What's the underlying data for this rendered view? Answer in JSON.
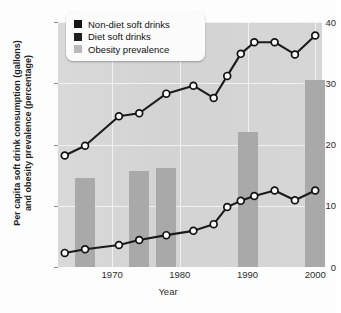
{
  "chart_data": {
    "type": "line",
    "title": "",
    "xlabel": "Year",
    "ylabel": "Per capita soft drink consumption (gallons) and obesity prevalence (percentage)",
    "ylabel_line1": "Per capita soft drink consumption (gallons)",
    "ylabel_line2": "and obesity prevalence (percentage)",
    "xlim": [
      1962,
      2001
    ],
    "ylim": [
      0,
      40
    ],
    "yticks": [
      0,
      10,
      20,
      30,
      40
    ],
    "xticks": [
      1970,
      1980,
      1990,
      2000
    ],
    "grid": true,
    "legend_position": "top-left",
    "legend": [
      {
        "label": "Non-diet soft drinks",
        "marker": "square",
        "color": "#141414"
      },
      {
        "label": "Diet soft drinks",
        "marker": "square",
        "color": "#1f1f1f"
      },
      {
        "label": "Obesity prevalence",
        "marker": "square",
        "color": "#b3b3b3"
      }
    ],
    "series": [
      {
        "name": "Non-diet soft drinks",
        "type": "line",
        "color": "#141414",
        "x": [
          1963,
          1966,
          1971,
          1974,
          1978,
          1982,
          1985,
          1987,
          1989,
          1991,
          1994,
          1997,
          2000
        ],
        "values": [
          18.2,
          19.8,
          24.6,
          25.1,
          28.3,
          29.6,
          27.6,
          31.2,
          34.8,
          36.7,
          36.7,
          34.7,
          37.8
        ]
      },
      {
        "name": "Diet soft drinks",
        "type": "line",
        "color": "#1f1f1f",
        "x": [
          1963,
          1966,
          1971,
          1974,
          1978,
          1982,
          1985,
          1987,
          1989,
          1991,
          1994,
          1997,
          2000
        ],
        "values": [
          2.3,
          2.9,
          3.6,
          4.4,
          5.2,
          5.9,
          7.0,
          9.8,
          10.8,
          11.6,
          12.5,
          10.9,
          12.5
        ]
      },
      {
        "name": "Obesity prevalence",
        "type": "bar",
        "color": "#a9a9a9",
        "x": [
          1966,
          1974,
          1978,
          1990,
          2000
        ],
        "values": [
          14.5,
          15.7,
          16.1,
          22.0,
          30.5
        ]
      }
    ]
  },
  "axis": {
    "y_ticks": [
      "0",
      "10",
      "20",
      "30",
      "40"
    ],
    "x_ticks": [
      "1970",
      "1980",
      "1990",
      "2000"
    ],
    "x_title": "Year",
    "y_title_line1": "Per capita soft drink consumption (gallons)",
    "y_title_line2": "and obesity prevalence (percentage)"
  },
  "legend": {
    "items": [
      {
        "label": "Non-diet soft drinks"
      },
      {
        "label": "Diet soft drinks"
      },
      {
        "label": "Obesity prevalence"
      }
    ]
  },
  "colors": {
    "plot_background": "#d5d5d5",
    "gridline": "#f2f2f2",
    "bar": "#a9a9a9",
    "line": "#1b1b1b",
    "marker_fill": "#ffffff",
    "page_background": "#ffffff"
  }
}
